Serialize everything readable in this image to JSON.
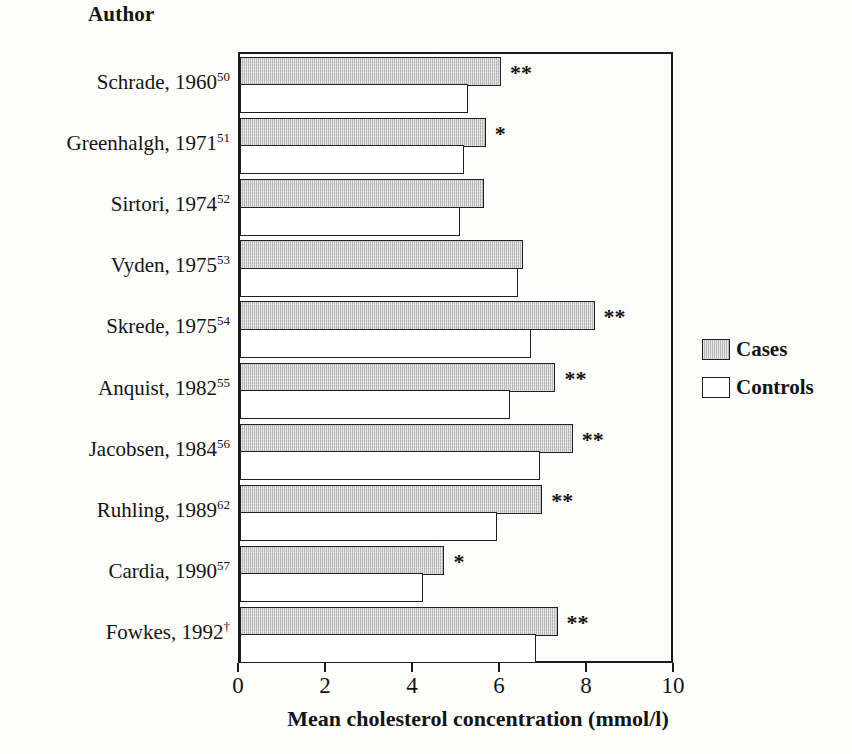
{
  "header": {
    "title": "Author"
  },
  "axis": {
    "xlabel": "Mean cholesterol concentration (mmol/l)",
    "ticks": [
      "0",
      "2",
      "4",
      "6",
      "8",
      "10"
    ]
  },
  "legend": {
    "items": [
      {
        "label": "Cases",
        "swatch": "cases-swatch",
        "color": "#c9c9c9"
      },
      {
        "label": "Controls",
        "swatch": "controls-swatch",
        "color": "#ffffff"
      }
    ]
  },
  "colors": {
    "cases_fill": "#c9c9c9",
    "controls_fill": "#ffffff",
    "outline": "#1f1f1f",
    "text": "#141414",
    "background": "#fdfdfc"
  },
  "chart_data": {
    "type": "bar",
    "orientation": "horizontal",
    "title": "",
    "xlabel": "Mean cholesterol concentration (mmol/l)",
    "ylabel": "Author",
    "xlim": [
      0,
      10
    ],
    "xticks": [
      0,
      2,
      4,
      6,
      8,
      10
    ],
    "grid": false,
    "legend_position": "right",
    "categories": [
      "Schrade, 1960⁵⁰",
      "Greenhalgh, 1971⁵¹",
      "Sirtori, 1974⁵²",
      "Vyden, 1975⁵³",
      "Skrede, 1975⁵⁴",
      "Anquist, 1982⁵⁵",
      "Jacobsen, 1984⁵⁶",
      "Ruhling, 1989⁶²",
      "Cardia, 1990⁵⁷",
      "Fowkes, 1992†"
    ],
    "category_parts": [
      {
        "name": "Schrade, 1960",
        "ref": "50"
      },
      {
        "name": "Greenhalgh, 1971",
        "ref": "51"
      },
      {
        "name": "Sirtori, 1974",
        "ref": "52"
      },
      {
        "name": "Vyden, 1975",
        "ref": "53"
      },
      {
        "name": "Skrede, 1975",
        "ref": "54"
      },
      {
        "name": "Anquist, 1982",
        "ref": "55"
      },
      {
        "name": "Jacobsen, 1984",
        "ref": "56"
      },
      {
        "name": "Ruhling, 1989",
        "ref": "62"
      },
      {
        "name": "Cardia, 1990",
        "ref": "57"
      },
      {
        "name": "Fowkes, 1992",
        "ref": "†"
      }
    ],
    "series": [
      {
        "name": "Cases",
        "values": [
          6.0,
          5.65,
          5.6,
          6.5,
          8.15,
          7.25,
          7.65,
          6.95,
          4.7,
          7.3
        ]
      },
      {
        "name": "Controls",
        "values": [
          5.25,
          5.15,
          5.05,
          6.4,
          6.7,
          6.2,
          6.9,
          5.9,
          4.2,
          6.8
        ]
      }
    ],
    "significance": [
      "**",
      "*",
      "",
      "",
      "**",
      "**",
      "**",
      "**",
      "*",
      "**"
    ]
  }
}
